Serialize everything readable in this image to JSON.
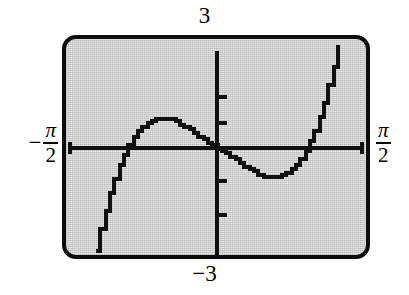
{
  "figure": {
    "kind": "graphing-calculator-screen"
  },
  "labels": {
    "y_max": "3",
    "y_min": "−3",
    "x_min_minus": "−",
    "x_min_numerator": "π",
    "x_min_denominator": "2",
    "x_max_numerator": "π",
    "x_max_denominator": "2"
  },
  "colors": {
    "screen_border": "#0d0d0d",
    "screen_fill": "#e8e8e8",
    "curve": "#111111",
    "axis": "#111111"
  },
  "chart_data": {
    "type": "line",
    "title": "",
    "xlabel": "",
    "ylabel": "",
    "xlim": [
      -1.5707963,
      1.5707963
    ],
    "ylim": [
      -3,
      3
    ],
    "xtick_labels": [
      "−π/2",
      "π/2"
    ],
    "ytick_labels": [
      "3",
      "−3"
    ],
    "grid": false,
    "legend": null,
    "axes": {
      "x_axis_at_y": 0,
      "y_axis_at_x": 0,
      "y_tick_values": [
        -2,
        -1,
        1,
        2
      ],
      "y_tick_style": "short marks on y-axis"
    },
    "series": [
      {
        "name": "curve",
        "x": [
          -1.3,
          -1.25,
          -1.2,
          -1.15,
          -1.1,
          -1.05,
          -1.0,
          -0.95,
          -0.9,
          -0.85,
          -0.8,
          -0.75,
          -0.7,
          -0.65,
          -0.6,
          -0.55,
          -0.5,
          -0.45,
          -0.4,
          -0.35,
          -0.3,
          -0.25,
          -0.2,
          -0.15,
          -0.1,
          -0.05,
          0.0,
          0.05,
          0.1,
          0.15,
          0.2,
          0.25,
          0.3,
          0.35,
          0.4,
          0.45,
          0.5,
          0.55,
          0.6,
          0.65,
          0.7,
          0.75,
          0.8,
          0.85,
          0.9,
          0.95,
          1.0,
          1.05,
          1.1,
          1.15,
          1.2,
          1.25,
          1.3
        ],
        "y": [
          -3.0,
          -2.38,
          -1.82,
          -1.32,
          -0.88,
          -0.5,
          -0.18,
          0.09,
          0.31,
          0.49,
          0.63,
          0.73,
          0.8,
          0.84,
          0.86,
          0.85,
          0.82,
          0.77,
          0.7,
          0.62,
          0.53,
          0.44,
          0.34,
          0.24,
          0.15,
          0.07,
          0.0,
          -0.07,
          -0.15,
          -0.24,
          -0.34,
          -0.44,
          -0.53,
          -0.62,
          -0.7,
          -0.77,
          -0.82,
          -0.85,
          -0.86,
          -0.84,
          -0.8,
          -0.73,
          -0.63,
          -0.49,
          -0.31,
          -0.09,
          0.18,
          0.5,
          0.88,
          1.32,
          1.82,
          2.38,
          3.0
        ],
        "note": "odd increasing-through-origin S curve: local max near x=-0.6 (y~0.86), local min near x=0.6 (y~-0.86), steep tails toward ±π/2"
      }
    ]
  }
}
